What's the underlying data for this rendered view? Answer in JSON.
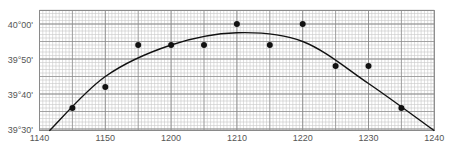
{
  "chart_data": {
    "type": "scatter",
    "title": "",
    "xlabel": "",
    "ylabel": "",
    "x_unit": "time (HHMM)",
    "y_unit": "latitude (degrees/minutes)",
    "xlim": [
      1140,
      1240
    ],
    "ylim": [
      "39°30'",
      "40°04'"
    ],
    "x_ticks": [
      "1140",
      "1150",
      "1200",
      "1210",
      "1220",
      "1230",
      "1240"
    ],
    "y_ticks": [
      "40°00'",
      "39°50'",
      "39°40'",
      "39°30'"
    ],
    "grid": true,
    "legend": null,
    "series": [
      {
        "name": "observations",
        "kind": "points",
        "points": [
          {
            "x": "1145",
            "y": "39°36'"
          },
          {
            "x": "1150",
            "y": "39°42'"
          },
          {
            "x": "1155",
            "y": "39°54'"
          },
          {
            "x": "1200",
            "y": "39°54'"
          },
          {
            "x": "1205",
            "y": "39°54'"
          },
          {
            "x": "1210",
            "y": "40°00'"
          },
          {
            "x": "1215",
            "y": "39°54'"
          },
          {
            "x": "1220",
            "y": "40°00'"
          },
          {
            "x": "1225",
            "y": "39°48'"
          },
          {
            "x": "1230",
            "y": "39°48'"
          },
          {
            "x": "1235",
            "y": "39°36'"
          }
        ]
      },
      {
        "name": "fitted curve",
        "kind": "curve",
        "points": [
          {
            "x": "1141.5",
            "y": "39°29.5'"
          },
          {
            "x": "1150",
            "y": "39°45'"
          },
          {
            "x": "1200",
            "y": "39°54'"
          },
          {
            "x": "1210",
            "y": "39°57.5'"
          },
          {
            "x": "1220",
            "y": "39°55'"
          },
          {
            "x": "1230",
            "y": "39°43'"
          },
          {
            "x": "1240",
            "y": "39°29.5'"
          }
        ]
      }
    ]
  },
  "axis": {
    "x_labels": [
      "1140",
      "1150",
      "1200",
      "1210",
      "1220",
      "1230",
      "1240"
    ],
    "y_labels": [
      "40°00'",
      "39°50'",
      "39°40'",
      "39°30'"
    ]
  },
  "colors": {
    "grid_minor": "#c8c8c8",
    "grid_major": "#8a8a8a",
    "frame": "#8a8a8a",
    "points": "#111111",
    "curve": "#111111",
    "labels": "#555555"
  }
}
